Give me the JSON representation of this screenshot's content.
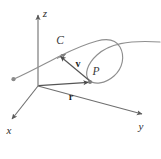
{
  "figure": {
    "background_color": "#ffffff",
    "axis_color": "#6b6b6b",
    "curve_color": "#8d8d8d",
    "vector_color": "#555555",
    "label_color": "#2b2b2b",
    "width": 161,
    "height": 159
  },
  "axes": {
    "z": {
      "label": "z",
      "label_x": 45,
      "label_y": 17,
      "arrow_dir": "up"
    },
    "x": {
      "label": "x",
      "label_x": 7,
      "label_y": 133,
      "arrow_dir": "down-left"
    },
    "y": {
      "label": "y",
      "label_x": 139,
      "label_y": 129,
      "arrow_dir": "down-right"
    },
    "origin": {
      "x": 38,
      "y": 85
    }
  },
  "curve": {
    "label": "C",
    "label_x": 60,
    "label_y": 43,
    "start_dot": {
      "x": 13,
      "y": 79
    },
    "direction_arrow": {
      "x": 64,
      "y": 56
    },
    "description": "space curve C with a loop"
  },
  "point": {
    "label": "P",
    "label_x": 96,
    "label_y": 74,
    "marker": {
      "x": 90,
      "y": 82
    }
  },
  "vectors": [
    {
      "name": "position-vector-r",
      "label": "r",
      "label_x": 71,
      "label_y": 99,
      "from": {
        "x": 38,
        "y": 85
      },
      "to": {
        "x": 90,
        "y": 82
      }
    },
    {
      "name": "velocity-vector-v",
      "label": "v",
      "label_x": 77,
      "label_y": 66,
      "from": {
        "x": 90,
        "y": 81
      },
      "to": {
        "x": 59,
        "y": 55
      }
    }
  ]
}
